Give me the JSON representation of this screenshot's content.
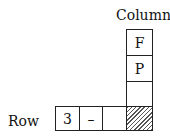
{
  "labels": {
    "column": "Column",
    "row": "Row"
  },
  "column_cells": [
    "F",
    "P",
    "",
    ""
  ],
  "row_cells": [
    "3",
    "–",
    "",
    ""
  ],
  "intersection": {
    "style": "hatched"
  }
}
